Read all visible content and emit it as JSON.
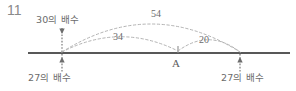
{
  "figure": {
    "problem_number": "11",
    "number_line": {
      "axis_color": "#585858",
      "x_start": 28,
      "x_end": 290,
      "y": 53
    },
    "points": [
      {
        "id": "left",
        "x": 62,
        "label_above": "30의 배수",
        "label_below": "27의 배수",
        "tick_above": true,
        "tick_below": true
      },
      {
        "id": "middle",
        "x": 178,
        "label_below": "A",
        "tick_above": true,
        "tick_below": false
      },
      {
        "id": "right",
        "x": 240,
        "label_below": "27의 배수",
        "tick_above": false,
        "tick_below": true
      }
    ],
    "arcs": [
      {
        "id": "arc-54",
        "value": "54",
        "from": "left",
        "to": "right",
        "from_x": 62,
        "to_x": 240,
        "peak_y": 18,
        "color": "#b4b4b4",
        "style": "dashed"
      },
      {
        "id": "arc-34",
        "value": "34",
        "from": "left",
        "to": "middle",
        "from_x": 62,
        "to_x": 178,
        "peak_y": 37,
        "color": "#b4b4b4",
        "style": "dashed"
      },
      {
        "id": "arc-20",
        "value": "20",
        "from": "middle",
        "to": "right",
        "from_x": 178,
        "to_x": 240,
        "peak_y": 40,
        "color": "#b4b4b4",
        "style": "dashed"
      }
    ],
    "colors": {
      "axis": "#585858",
      "arc": "#b4b4b4",
      "text": "#6b6b6b",
      "background": "#ffffff"
    }
  }
}
